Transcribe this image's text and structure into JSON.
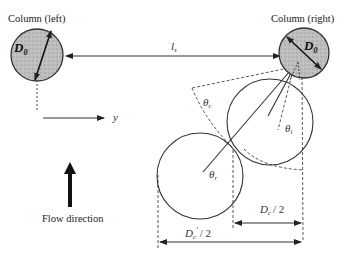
{
  "figure": {
    "columns": {
      "left": {
        "label": "Column (left)",
        "diameter_symbol": "D",
        "diameter_subscript": "0"
      },
      "right": {
        "label": "Column (right)",
        "diameter_symbol": "D",
        "diameter_subscript": "0"
      }
    },
    "spacing_label": {
      "symbol": "l",
      "subscript": "s"
    },
    "axis_label": "y",
    "flow_label": "Flow direction",
    "angles": {
      "theta_c": {
        "symbol": "θ",
        "subscript": "c"
      },
      "theta_i": {
        "symbol": "θ",
        "subscript": "i"
      },
      "theta_r": {
        "symbol": "θ",
        "subscript": "r"
      }
    },
    "dimensions": {
      "dc_half": {
        "symbol": "D",
        "subscript": "c",
        "suffix": "/ 2"
      },
      "dc_prime_half": {
        "symbol": "D",
        "subscript": "c",
        "prime": "'",
        "suffix": "/ 2"
      }
    },
    "colors": {
      "column_fill": "#b8b8b8",
      "line": "#333333",
      "background": "#ffffff"
    }
  }
}
